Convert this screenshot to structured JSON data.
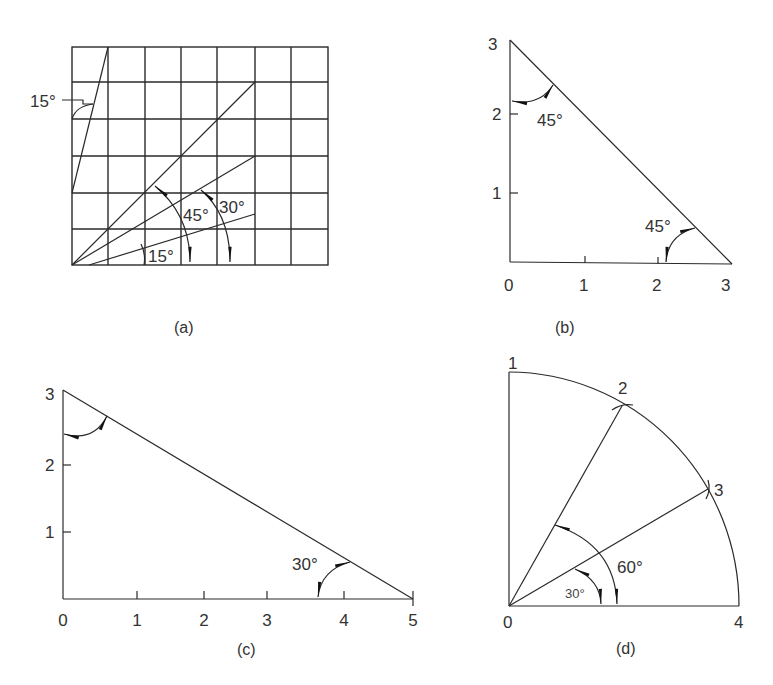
{
  "figure": {
    "panels": [
      {
        "id": "a",
        "caption": "(a)",
        "type": "grid-angles",
        "grid": {
          "columns": 7,
          "rows": 6
        },
        "angle_labels": [
          "15°",
          "45°",
          "30°",
          "15°"
        ]
      },
      {
        "id": "b",
        "caption": "(b)",
        "type": "right-triangle",
        "x_ticks": [
          "0",
          "1",
          "2",
          "3"
        ],
        "y_ticks": [
          "1",
          "2",
          "3"
        ],
        "angle_labels": [
          "45°",
          "45°"
        ]
      },
      {
        "id": "c",
        "caption": "(c)",
        "type": "right-triangle",
        "x_ticks": [
          "0",
          "1",
          "2",
          "3",
          "4",
          "5"
        ],
        "y_ticks": [
          "1",
          "2",
          "3"
        ],
        "angle_labels": [
          "30°"
        ]
      },
      {
        "id": "d",
        "caption": "(d)",
        "type": "quarter-circle",
        "point_labels": [
          "0",
          "1",
          "2",
          "3",
          "4"
        ],
        "angle_labels": [
          "60°",
          "30°"
        ]
      }
    ]
  }
}
